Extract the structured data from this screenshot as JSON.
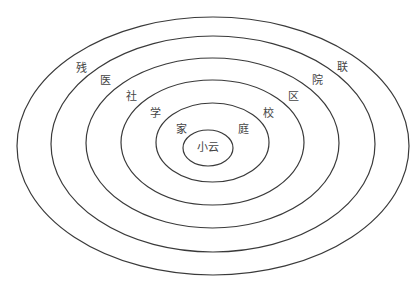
{
  "diagram": {
    "type": "concentric-ellipses",
    "center_label": "小云",
    "rings": [
      {
        "name": "family",
        "left": "家",
        "right": "庭"
      },
      {
        "name": "school",
        "left": "学",
        "right": "校"
      },
      {
        "name": "community",
        "left": "社",
        "right": "区"
      },
      {
        "name": "hospital",
        "left": "医",
        "right": "院"
      },
      {
        "name": "disabled-federation",
        "left": "残",
        "right": "联"
      }
    ]
  }
}
